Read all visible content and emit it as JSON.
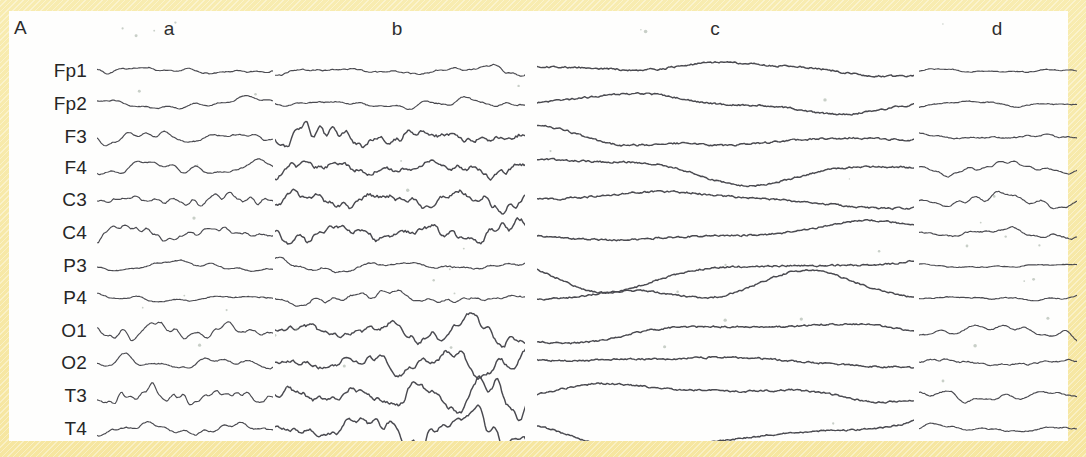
{
  "figure": {
    "panel_letter": "A",
    "background_color": "#f7e9a8",
    "plate_color": "#fefefd",
    "trace_color": "#4a4a50"
  },
  "columns": [
    {
      "label": "a",
      "center_x": 160,
      "x": 88,
      "width": 176
    },
    {
      "label": "b",
      "center_x": 388,
      "x": 266,
      "width": 250
    },
    {
      "label": "c",
      "center_x": 706,
      "x": 528,
      "width": 377
    },
    {
      "label": "d",
      "center_x": 988,
      "x": 910,
      "width": 158
    }
  ],
  "channels": [
    {
      "label": "Fp1",
      "y": 60
    },
    {
      "label": "Fp2",
      "y": 93
    },
    {
      "label": "F3",
      "y": 126
    },
    {
      "label": "F4",
      "y": 157
    },
    {
      "label": "C3",
      "y": 189
    },
    {
      "label": "C4",
      "y": 222
    },
    {
      "label": "P3",
      "y": 255
    },
    {
      "label": "P4",
      "y": 287
    },
    {
      "label": "O1",
      "y": 320
    },
    {
      "label": "O2",
      "y": 352
    },
    {
      "label": "T3",
      "y": 385
    },
    {
      "label": "T4",
      "y": 418
    }
  ],
  "chart_data": {
    "type": "line",
    "title": "A",
    "xlabel": "",
    "ylabel": "",
    "grid": false,
    "legend": "none",
    "categories": [
      "Fp1",
      "Fp2",
      "F3",
      "F4",
      "C3",
      "C4",
      "P3",
      "P4",
      "O1",
      "O2",
      "T3",
      "T4"
    ],
    "segments": [
      {
        "name": "a",
        "pattern": "low-amplitude mixed fast activity",
        "amplitude_relative": [
          0.22,
          0.2,
          0.26,
          0.26,
          0.42,
          0.4,
          0.22,
          0.2,
          0.4,
          0.3,
          0.46,
          0.32
        ],
        "dominant_frequency_relative": [
          1.0,
          0.9,
          1.3,
          1.2,
          1.5,
          1.5,
          0.8,
          0.8,
          1.5,
          1.1,
          1.6,
          1.2
        ]
      },
      {
        "name": "b",
        "pattern": "high-amplitude rhythmic theta-delta bursts",
        "amplitude_relative": [
          0.3,
          0.26,
          1.0,
          0.95,
          1.0,
          0.95,
          0.35,
          0.4,
          0.9,
          0.85,
          1.0,
          0.8
        ],
        "dominant_frequency_relative": [
          1.1,
          1.0,
          1.5,
          1.4,
          1.5,
          1.4,
          1.0,
          1.0,
          1.5,
          1.4,
          1.6,
          1.4
        ]
      },
      {
        "name": "c",
        "pattern": "large slow delta waves",
        "amplitude_relative": [
          0.95,
          0.9,
          0.95,
          0.92,
          0.95,
          0.9,
          0.85,
          0.88,
          0.92,
          0.9,
          0.92,
          0.85
        ],
        "dominant_frequency_relative": [
          0.55,
          0.52,
          0.55,
          0.52,
          0.55,
          0.5,
          0.5,
          0.52,
          0.55,
          0.52,
          0.55,
          0.5
        ]
      },
      {
        "name": "d",
        "pattern": "low-amplitude attenuated activity",
        "amplitude_relative": [
          0.2,
          0.18,
          0.26,
          0.24,
          0.34,
          0.32,
          0.14,
          0.18,
          0.26,
          0.32,
          0.28,
          0.26
        ],
        "dominant_frequency_relative": [
          1.0,
          0.9,
          1.2,
          1.1,
          1.3,
          1.2,
          0.8,
          0.9,
          1.1,
          1.2,
          1.2,
          1.1
        ]
      }
    ]
  }
}
